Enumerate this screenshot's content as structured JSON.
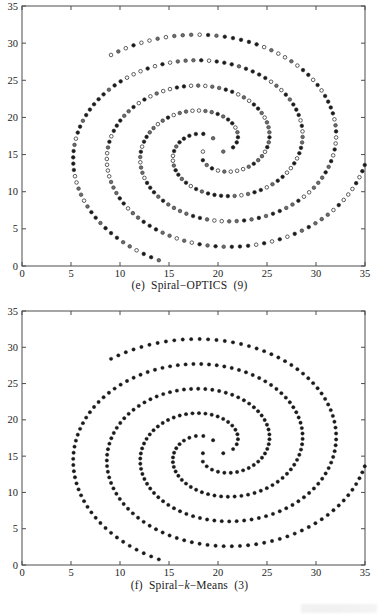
{
  "figure": {
    "panels": [
      {
        "id": "e",
        "caption_prefix": "(e)",
        "caption_main": "Spiral−OPTICS",
        "caption_count": "(9)",
        "caption_full": "(e)  Spiral−OPTICS  (9)"
      },
      {
        "id": "f",
        "caption_prefix": "(f)",
        "caption_main_pre": "Spiral−",
        "caption_italic": "k",
        "caption_main_post": "−Means",
        "caption_count": "(3)",
        "caption_full": "(f)  Spiral−k−Means  (3)"
      }
    ]
  },
  "colors": {
    "axis": "#4d4d4d",
    "marker_dark": "#1a1a1a",
    "marker_gray": "#6e6e6e",
    "marker_open_face": "#ffffff",
    "marker_edge": "#2b2b2b",
    "background": "#ffffff",
    "text": "#1b1b1b"
  },
  "chart_data": [
    {
      "type": "scatter",
      "title": "(e)  Spiral−OPTICS  (9)",
      "xlabel": "",
      "ylabel": "",
      "xlim": [
        0,
        35
      ],
      "ylim": [
        0,
        35
      ],
      "xticks": [
        0,
        5,
        10,
        15,
        20,
        25,
        30,
        35
      ],
      "yticks": [
        0,
        5,
        10,
        15,
        20,
        25,
        30,
        35
      ],
      "grid": false,
      "legend": "none",
      "marker": "circle",
      "marker_size_px": 3.6,
      "description": "Three interleaved Archimedean spiral arms of ~105 points each, emanating from a common centre near (19.5, 16) and winding counter-clockwise outward to a radius of ~16 units. Marker face colours vary per point between solid black, mid-grey and unfilled white, representing the 9 clusters found by OPTICS.",
      "n_arms": 3,
      "points_per_arm": 105,
      "center": [
        19.5,
        16.0
      ],
      "arm_start_angles_deg": [
        90,
        210,
        330
      ],
      "r_start": 1.2,
      "r_end": 16.2,
      "turn_total_deg": 520,
      "cluster_count": 9,
      "fill_pattern": "mixed: black / grey / open",
      "series": [
        {
          "name": "arm-1",
          "start_angle_deg": 90,
          "fill": "mixed"
        },
        {
          "name": "arm-2",
          "start_angle_deg": 210,
          "fill": "mixed"
        },
        {
          "name": "arm-3",
          "start_angle_deg": 330,
          "fill": "mixed"
        }
      ],
      "extreme_points": [
        {
          "label": "top arm tip",
          "x": 19.0,
          "y": 32.0
        },
        {
          "label": "right arm tip",
          "x": 31.8,
          "y": 8.6
        },
        {
          "label": "left arm tip",
          "x": 3.8,
          "y": 9.7
        }
      ]
    },
    {
      "type": "scatter",
      "title": "(f)  Spiral−k−Means  (3)",
      "xlabel": "",
      "ylabel": "",
      "xlim": [
        0,
        35
      ],
      "ylim": [
        0,
        35
      ],
      "xticks": [
        0,
        5,
        10,
        15,
        20,
        25,
        30,
        35
      ],
      "yticks": [
        0,
        5,
        10,
        15,
        20,
        25,
        30,
        35
      ],
      "grid": false,
      "legend": "none",
      "marker": "circle",
      "marker_size_px": 3.4,
      "description": "Same three interleaved Archimedean spiral arms as panel (e), but every marker is drawn solid dark, representing the 3 clusters produced by k-Means.",
      "n_arms": 3,
      "points_per_arm": 105,
      "center": [
        19.5,
        16.0
      ],
      "arm_start_angles_deg": [
        90,
        210,
        330
      ],
      "r_start": 1.2,
      "r_end": 16.2,
      "turn_total_deg": 520,
      "cluster_count": 3,
      "fill_pattern": "uniform dark",
      "series": [
        {
          "name": "arm-1",
          "start_angle_deg": 90,
          "fill": "dark"
        },
        {
          "name": "arm-2",
          "start_angle_deg": 210,
          "fill": "dark"
        },
        {
          "name": "arm-3",
          "start_angle_deg": 330,
          "fill": "dark"
        }
      ],
      "extreme_points": [
        {
          "label": "top arm tip",
          "x": 19.0,
          "y": 32.0
        },
        {
          "label": "right arm tip",
          "x": 31.8,
          "y": 8.6
        },
        {
          "label": "left arm tip",
          "x": 3.8,
          "y": 9.7
        }
      ]
    }
  ]
}
